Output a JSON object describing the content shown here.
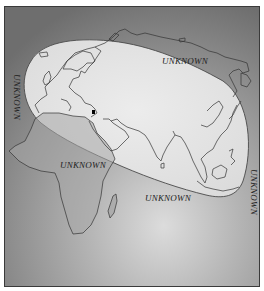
{
  "map": {
    "title": "",
    "regions": {
      "known": "Eurasia, North Africa and Indian subcontinent (highlighted ellipse)",
      "unknown_label": "UNKNOWN"
    },
    "labels": [
      {
        "id": "north",
        "text": "UNKNOWN",
        "x": 161,
        "y": 55,
        "rotation": 0
      },
      {
        "id": "west",
        "text": "UNKNOWN",
        "x": 15,
        "y": 73,
        "rotation": 90
      },
      {
        "id": "africa",
        "text": "UNKNOWN",
        "x": 59,
        "y": 159,
        "rotation": 0
      },
      {
        "id": "indian-ocean",
        "text": "UNKNOWN",
        "x": 144,
        "y": 192,
        "rotation": 0
      },
      {
        "id": "east",
        "text": "UNKNOWN",
        "x": 254,
        "y": 168,
        "rotation": 90
      }
    ],
    "marker": {
      "x": 92,
      "y": 111,
      "color": "#000000"
    },
    "colors": {
      "background_dark": "#7d7d7d",
      "background_light": "#d6d6d6",
      "known_fill": "#e4e4e4",
      "outline": "#3a3a3a",
      "coastline": "#444444"
    }
  }
}
